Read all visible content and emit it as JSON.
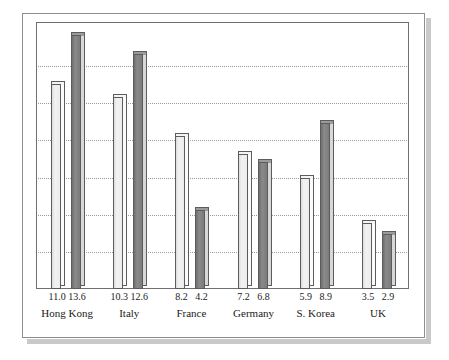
{
  "chart_data": {
    "type": "bar",
    "title": "",
    "subtitle": "",
    "xlabel": "",
    "ylabel": "",
    "ylim": [
      0,
      14
    ],
    "grid": true,
    "gridlines": [
      2,
      4,
      6,
      8,
      10,
      12
    ],
    "legend_position": "none",
    "categories": [
      "Hong Kong",
      "Italy",
      "France",
      "Germany",
      "S. Korea",
      "UK"
    ],
    "series": [
      {
        "name": "series-a",
        "style": "light",
        "color": "#ededed",
        "values": [
          11.0,
          10.3,
          8.2,
          7.2,
          5.9,
          3.5
        ],
        "labels": [
          "11.0",
          "10.3",
          "8.2",
          "7.2",
          "5.9",
          "3.5"
        ]
      },
      {
        "name": "series-b",
        "style": "dark",
        "color": "#7b7b7b",
        "values": [
          13.6,
          12.6,
          4.2,
          6.8,
          8.9,
          2.9
        ],
        "labels": [
          "13.6",
          "12.6",
          "4.2",
          "6.8",
          "8.9",
          "2.9"
        ]
      }
    ]
  },
  "colors": {
    "light_bar": "#ededed",
    "dark_bar": "#7b7b7b",
    "bar_outline": "#5c5c5c",
    "gridline": "#9a9a9a",
    "frame": "#8d8d8d",
    "plot_border": "#6f6f6f",
    "shadow": "#c9c9c9",
    "text": "#1b1b1b",
    "background": "#ffffff"
  }
}
